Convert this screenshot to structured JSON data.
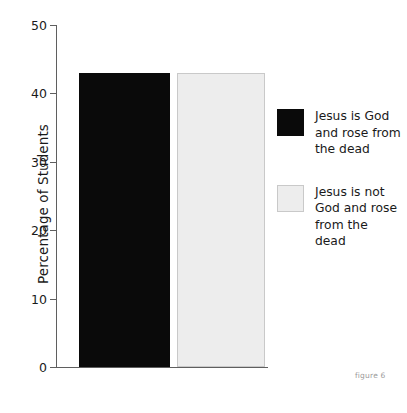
{
  "chart_data": {
    "type": "bar",
    "title": "",
    "xlabel": "",
    "ylabel": "Percentage of Students",
    "ylim": [
      0,
      50
    ],
    "yticks": [
      0,
      10,
      20,
      30,
      40,
      50
    ],
    "ytick_labels": [
      "0",
      "10",
      "20",
      "30",
      "40",
      "50"
    ],
    "grid": false,
    "legend_position": "right",
    "categories": [
      "Jesus is God and rose from the dead",
      "Jesus is not God and rose from the dead"
    ],
    "values": [
      43,
      43
    ],
    "colors": [
      "#0a0a0a",
      "#ededed"
    ],
    "bar_edge_colors": [
      "#0a0a0a",
      "#c9c9c9"
    ]
  },
  "axis": {
    "y_title": "Percentage of Students",
    "ticks": [
      {
        "label": "50",
        "value": 50
      },
      {
        "label": "40",
        "value": 40
      },
      {
        "label": "30",
        "value": 30
      },
      {
        "label": "20",
        "value": 20
      },
      {
        "label": "10",
        "value": 10
      },
      {
        "label": "0",
        "value": 0
      }
    ]
  },
  "legend": {
    "entries": [
      {
        "label": "Jesus is God and rose from the dead",
        "color": "#0a0a0a"
      },
      {
        "label": "Jesus is not God and rose from the dead",
        "color": "#ededed"
      }
    ]
  },
  "caption": {
    "text": "figure 6"
  }
}
